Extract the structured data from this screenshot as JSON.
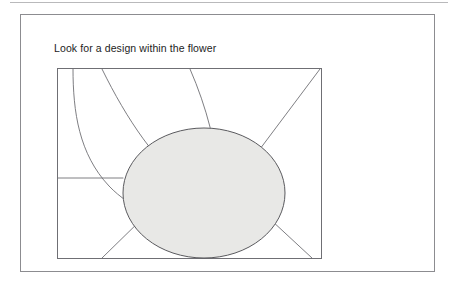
{
  "page": {
    "background_color": "#ffffff",
    "width": 455,
    "height": 288
  },
  "top_rule": {
    "color": "#b9b9bb"
  },
  "figure": {
    "border_color": "#8c8c90",
    "caption": "Look for a design within the flower",
    "caption_color": "#1c1c1c"
  },
  "drawing": {
    "name": "flower-line-drawing",
    "frame": {
      "stroke": "#6f6f74",
      "fill": "#ffffff",
      "x": 0,
      "y": 0,
      "width": 264,
      "height": 190
    },
    "center": {
      "name": "flower-center-ellipse",
      "cx": 147,
      "cy": 125,
      "rx": 81,
      "ry": 65,
      "fill": "#e8e8e6",
      "stroke": "#5a5a5e"
    },
    "petals": {
      "stroke": "#6f6f74",
      "stroke_width": 0.9,
      "paths": [
        "M 16 1 C 16 44, 22 86, 52 118 C 74 141, 104 152, 132 155",
        "M 45 1 C 70 52, 100 96, 135 122",
        "M 133 1 C 150 40, 160 80, 162 114",
        "M 263 1 L 176 117",
        "M 255 190 L 214 152",
        "M 45 190 L 88 148",
        "M -2 110 L 66 110"
      ]
    }
  }
}
